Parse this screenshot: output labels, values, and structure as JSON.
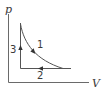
{
  "diagram": {
    "type": "pv-cycle",
    "axes": {
      "y_label": "p",
      "x_label": "V"
    },
    "processes": [
      {
        "id": "1",
        "label": "1",
        "shape": "curve",
        "direction": "down-right"
      },
      {
        "id": "2",
        "label": "2",
        "shape": "horizontal-line",
        "direction": "left"
      },
      {
        "id": "3",
        "label": "3",
        "shape": "vertical-line",
        "direction": "up"
      }
    ],
    "colors": {
      "axis": "#6a6a6a",
      "cycle": "#555555",
      "text": "#3a3a3a"
    }
  }
}
